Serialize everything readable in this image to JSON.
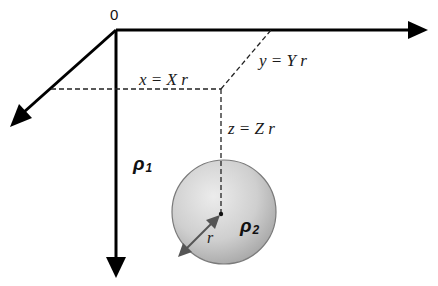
{
  "diagram": {
    "origin_label": "0",
    "axes": [
      {
        "name": "y-axis",
        "direction": "right"
      },
      {
        "name": "x-axis",
        "direction": "down-left"
      },
      {
        "name": "z-axis",
        "direction": "down"
      }
    ],
    "labels": {
      "x": "x = X r",
      "y": "y = Y r",
      "z": "z = Z r",
      "radius": "r"
    },
    "media": {
      "rho1_symbol": "ρ",
      "rho1_sub": "1",
      "rho2_symbol": "ρ",
      "rho2_sub": "2"
    },
    "colors": {
      "line": "#000000",
      "sphere_fill_light": "#e6e6e6",
      "sphere_fill_dark": "#a8a8a8",
      "sphere_stroke": "#777777",
      "radius_arrow": "#555555"
    }
  }
}
